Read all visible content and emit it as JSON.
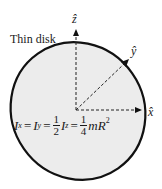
{
  "diagram": {
    "title": "Thin disk",
    "axes": {
      "z": "ẑ",
      "y": "ŷ",
      "x": "x̂"
    },
    "formula": {
      "Ix": "I",
      "Ix_sub": "x",
      "eq1": "=",
      "Iy": "I",
      "Iy_sub": "y",
      "eq2": "=",
      "half_num": "1",
      "half_den": "2",
      "Iz": "I",
      "Iz_sub": "z",
      "eq3": "=",
      "quarter_num": "1",
      "quarter_den": "4",
      "tail": "mR",
      "tail_sup": "2"
    },
    "colors": {
      "disk_fill": "#ececec",
      "outline": "#111111",
      "text": "#1a1a1a"
    }
  }
}
